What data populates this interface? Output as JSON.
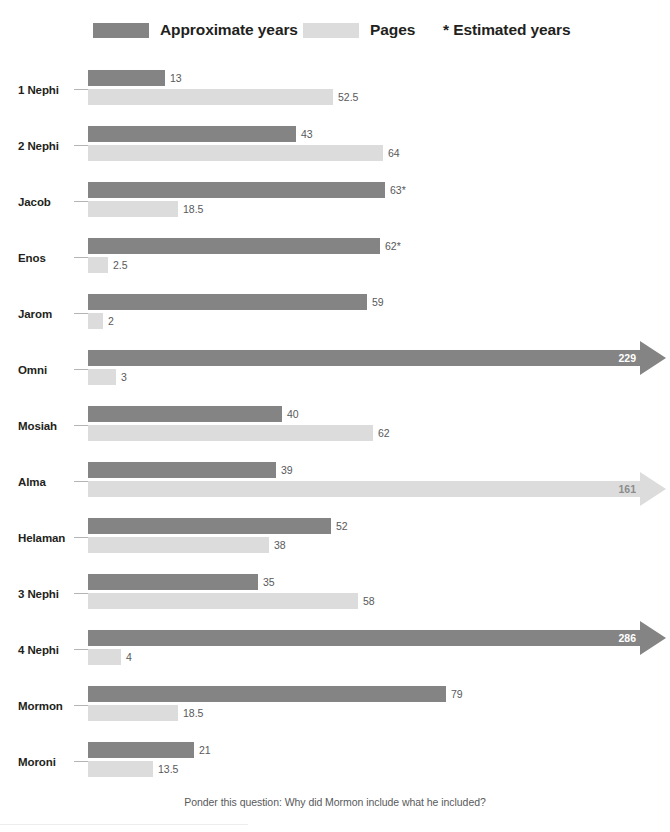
{
  "top_caption": {
    "left": "",
    "right": ""
  },
  "legend": {
    "years": {
      "label": "Approximate years",
      "color": "#848484",
      "swatch_icon": "legend-swatch"
    },
    "pages": {
      "label": "Pages",
      "color": "#dcdcdc",
      "swatch_icon": "legend-swatch"
    },
    "note": "* Estimated years"
  },
  "footer": {
    "text": "Ponder this question: Why did Mormon include what he included?"
  },
  "chart_data": {
    "type": "bar",
    "orientation": "horizontal",
    "title": "",
    "xlabel": "",
    "ylabel": "",
    "grid": false,
    "legend_position": "top",
    "categories": [
      "1 Nephi",
      "2 Nephi",
      "Jacob",
      "Enos",
      "Jarom",
      "Omni",
      "Mosiah",
      "Alma",
      "Helaman",
      "3 Nephi",
      "4 Nephi",
      "Mormon",
      "Moroni"
    ],
    "series": [
      {
        "name": "Approximate years",
        "color": "#848484",
        "values": [
          13,
          43,
          63,
          62,
          59,
          229,
          40,
          39,
          52,
          35,
          286,
          79,
          21
        ]
      },
      {
        "name": "Pages",
        "color": "#dcdcdc",
        "values": [
          52.5,
          64,
          18.5,
          2.5,
          2,
          3,
          62,
          161,
          38,
          58,
          4,
          18.5,
          13.5
        ]
      }
    ],
    "rows": [
      {
        "label": "1 Nephi",
        "years": {
          "value": 13,
          "display": "13",
          "px": 77,
          "arrow": false,
          "estimated": false
        },
        "pages": {
          "value": 52.5,
          "display": "52.5",
          "px": 245,
          "arrow": false
        }
      },
      {
        "label": "2 Nephi",
        "years": {
          "value": 43,
          "display": "43",
          "px": 208,
          "arrow": false,
          "estimated": false
        },
        "pages": {
          "value": 64,
          "display": "64",
          "px": 295,
          "arrow": false
        }
      },
      {
        "label": "Jacob",
        "years": {
          "value": 63,
          "display": "63*",
          "px": 297,
          "arrow": false,
          "estimated": true
        },
        "pages": {
          "value": 18.5,
          "display": "18.5",
          "px": 90,
          "arrow": false
        }
      },
      {
        "label": "Enos",
        "years": {
          "value": 62,
          "display": "62*",
          "px": 292,
          "arrow": false,
          "estimated": true
        },
        "pages": {
          "value": 2.5,
          "display": "2.5",
          "px": 20,
          "arrow": false
        }
      },
      {
        "label": "Jarom",
        "years": {
          "value": 59,
          "display": "59",
          "px": 279,
          "arrow": false,
          "estimated": false
        },
        "pages": {
          "value": 2,
          "display": "2",
          "px": 15,
          "arrow": false
        }
      },
      {
        "label": "Omni",
        "years": {
          "value": 229,
          "display": "229",
          "px": 552,
          "arrow": true,
          "estimated": false
        },
        "pages": {
          "value": 3,
          "display": "3",
          "px": 28,
          "arrow": false
        }
      },
      {
        "label": "Mosiah",
        "years": {
          "value": 40,
          "display": "40",
          "px": 194,
          "arrow": false,
          "estimated": false
        },
        "pages": {
          "value": 62,
          "display": "62",
          "px": 285,
          "arrow": false
        }
      },
      {
        "label": "Alma",
        "years": {
          "value": 39,
          "display": "39",
          "px": 188,
          "arrow": false,
          "estimated": false
        },
        "pages": {
          "value": 161,
          "display": "161",
          "px": 552,
          "arrow": true
        }
      },
      {
        "label": "Helaman",
        "years": {
          "value": 52,
          "display": "52",
          "px": 243,
          "arrow": false,
          "estimated": false
        },
        "pages": {
          "value": 38,
          "display": "38",
          "px": 181,
          "arrow": false
        }
      },
      {
        "label": "3 Nephi",
        "years": {
          "value": 35,
          "display": "35",
          "px": 170,
          "arrow": false,
          "estimated": false
        },
        "pages": {
          "value": 58,
          "display": "58",
          "px": 270,
          "arrow": false
        }
      },
      {
        "label": "4 Nephi",
        "years": {
          "value": 286,
          "display": "286",
          "px": 552,
          "arrow": true,
          "estimated": false
        },
        "pages": {
          "value": 4,
          "display": "4",
          "px": 33,
          "arrow": false
        }
      },
      {
        "label": "Mormon",
        "years": {
          "value": 79,
          "display": "79",
          "px": 358,
          "arrow": false,
          "estimated": false
        },
        "pages": {
          "value": 18.5,
          "display": "18.5",
          "px": 90,
          "arrow": false
        }
      },
      {
        "label": "Moroni",
        "years": {
          "value": 21,
          "display": "21",
          "px": 106,
          "arrow": false,
          "estimated": false
        },
        "pages": {
          "value": 13.5,
          "display": "13.5",
          "px": 65,
          "arrow": false
        }
      }
    ]
  }
}
